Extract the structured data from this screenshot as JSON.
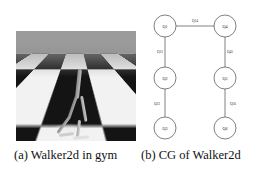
{
  "figure": {
    "panels": [
      {
        "id": "panel-a",
        "caption": "(a) Walker2d in gym",
        "content_kind": "mujoco-render",
        "description": "Walker2d humanoid walker rendered on an infinite checkerboard plane"
      },
      {
        "id": "panel-b",
        "caption": "(b) CG of Walker2d",
        "content_kind": "computation-graph"
      }
    ]
  },
  "graph": {
    "nodes": [
      {
        "id": "n1",
        "label": "Q1",
        "cx": 22,
        "cy": 20,
        "r": 11
      },
      {
        "id": "n2",
        "label": "Q4",
        "cx": 82,
        "cy": 20,
        "r": 11
      },
      {
        "id": "n3",
        "label": "Q2",
        "cx": 22,
        "cy": 72,
        "r": 11
      },
      {
        "id": "n4",
        "label": "Q5",
        "cx": 82,
        "cy": 72,
        "r": 11
      },
      {
        "id": "n5",
        "label": "Q3",
        "cx": 22,
        "cy": 122,
        "r": 11
      },
      {
        "id": "n6",
        "label": "Q6",
        "cx": 82,
        "cy": 122,
        "r": 11
      }
    ],
    "edges": [
      {
        "id": "e1",
        "from": "n1",
        "to": "n2",
        "label": "Q14",
        "lx": 52,
        "ly": 15
      },
      {
        "id": "e2",
        "from": "n1",
        "to": "n3",
        "label": "Q12",
        "lx": 17,
        "ly": 46
      },
      {
        "id": "e3",
        "from": "n2",
        "to": "n4",
        "label": "Q45",
        "lx": 87,
        "ly": 46
      },
      {
        "id": "e4",
        "from": "n3",
        "to": "n5",
        "label": "Q23",
        "lx": 14,
        "ly": 98
      },
      {
        "id": "e5",
        "from": "n4",
        "to": "n6",
        "label": "Q56",
        "lx": 90,
        "ly": 98
      }
    ],
    "colors": {
      "node_stroke": "#4a4a4a",
      "node_fill": "#ffffff",
      "edge_stroke": "#4a4a4a",
      "text": "#222222"
    }
  }
}
